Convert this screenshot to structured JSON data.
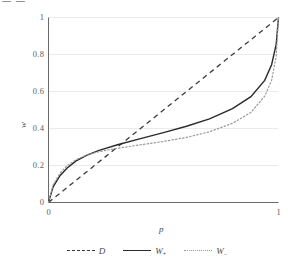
{
  "top_text": {
    "value": "— —      "
  },
  "chart_data": {
    "type": "line",
    "title": "",
    "xlabel": "p",
    "ylabel": "w",
    "xlim": [
      0,
      1
    ],
    "ylim": [
      0,
      1
    ],
    "grid": true,
    "grid_axis": "y",
    "legend_position": "bottom-center",
    "xticks": [
      "0",
      "1"
    ],
    "xtick_values": [
      0,
      1
    ],
    "yticks": [
      "0",
      "0.2",
      "0.4",
      "0.6",
      "0.8",
      "1"
    ],
    "ytick_values": [
      0,
      0.2,
      0.4,
      0.6,
      0.8,
      1.0
    ],
    "series": [
      {
        "name": "D",
        "label": "D",
        "style": "dashed",
        "color": "#3c3c3c",
        "x": [
          0,
          0.1,
          0.2,
          0.3,
          0.4,
          0.5,
          0.6,
          0.7,
          0.8,
          0.9,
          1.0
        ],
        "values": [
          0,
          0.1,
          0.2,
          0.3,
          0.4,
          0.5,
          0.6,
          0.7,
          0.8,
          0.9,
          1.0
        ]
      },
      {
        "name": "W_plus",
        "label": "W",
        "sub": "+",
        "style": "solid",
        "color": "#2a2a2a",
        "x": [
          0,
          0.02,
          0.05,
          0.08,
          0.12,
          0.17,
          0.22,
          0.3,
          0.4,
          0.5,
          0.6,
          0.7,
          0.8,
          0.88,
          0.94,
          0.97,
          0.99,
          1.0
        ],
        "values": [
          0,
          0.085,
          0.145,
          0.185,
          0.225,
          0.258,
          0.282,
          0.312,
          0.345,
          0.378,
          0.412,
          0.452,
          0.508,
          0.572,
          0.66,
          0.745,
          0.855,
          1.0
        ]
      },
      {
        "name": "W_minus",
        "label": "W",
        "sub": "−",
        "style": "dotted",
        "color": "#9a9a9a",
        "x": [
          0,
          0.02,
          0.05,
          0.08,
          0.12,
          0.17,
          0.22,
          0.3,
          0.4,
          0.5,
          0.6,
          0.7,
          0.8,
          0.88,
          0.94,
          0.97,
          0.99,
          1.0
        ],
        "values": [
          0,
          0.095,
          0.158,
          0.198,
          0.232,
          0.258,
          0.275,
          0.293,
          0.312,
          0.33,
          0.352,
          0.382,
          0.428,
          0.487,
          0.575,
          0.66,
          0.79,
          1.0
        ]
      }
    ]
  }
}
